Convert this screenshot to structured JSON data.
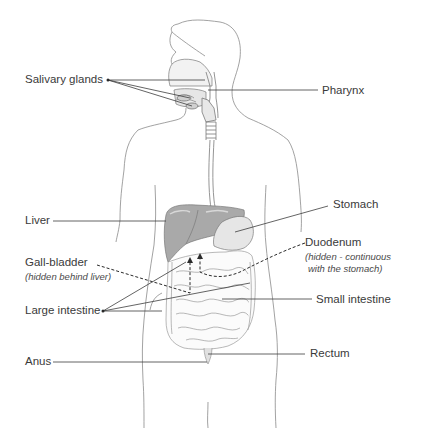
{
  "diagram": {
    "colors": {
      "outline": "#8a8a8a",
      "leader": "#3c3c3c",
      "organ_fill": "#a9a9a9",
      "organ_light": "#d8d8d8",
      "text": "#3a3a3a"
    },
    "labels": {
      "salivary_glands": "Salivary glands",
      "pharynx": "Pharynx",
      "liver": "Liver",
      "stomach": "Stomach",
      "duodenum": "Duodenum",
      "duodenum_note_1": "(hidden - continuous",
      "duodenum_note_2": "with the stomach)",
      "gall_bladder": "Gall-bladder",
      "gall_bladder_note": "(hidden behind liver)",
      "large_intestine": "Large intestine",
      "small_intestine": "Small intestine",
      "rectum": "Rectum",
      "anus": "Anus"
    }
  }
}
